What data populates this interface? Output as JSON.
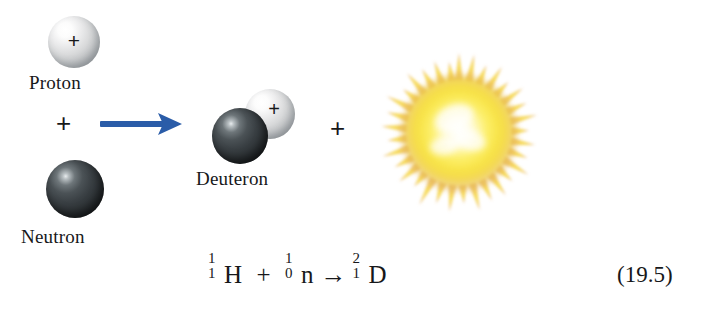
{
  "figure": {
    "background_color": "#ffffff"
  },
  "reactants": [
    {
      "id": "proton",
      "label": "Proton",
      "charge_symbol": "+",
      "sphere_color": "#d9dadb",
      "sphere_kind": "light"
    },
    {
      "id": "neutron",
      "label": "Neutron",
      "charge_symbol": "",
      "sphere_color": "#2c3134",
      "sphere_kind": "dark"
    }
  ],
  "products": [
    {
      "id": "deuteron",
      "label": "Deuteron",
      "charge_symbol": "+",
      "proton_sphere_color": "#d9dadb",
      "neutron_sphere_color": "#2c3134"
    },
    {
      "id": "energy-burst",
      "label": "",
      "center_color": "#fffde3",
      "mid_color": "#f7e64a",
      "edge_color": "#e4a martial"
    }
  ],
  "operators": {
    "reactant_plus": "+",
    "product_plus": "+",
    "arrow_color": "#2a5ca8"
  },
  "equation": {
    "hydrogen": {
      "mass_number": "1",
      "atomic_number": "1",
      "symbol": "H"
    },
    "plus": "+",
    "neutron": {
      "mass_number": "1",
      "atomic_number": "0",
      "symbol": "n"
    },
    "arrow": "→",
    "deuterium": {
      "mass_number": "2",
      "atomic_number": "1",
      "symbol": "D"
    },
    "number": "(19.5)"
  }
}
